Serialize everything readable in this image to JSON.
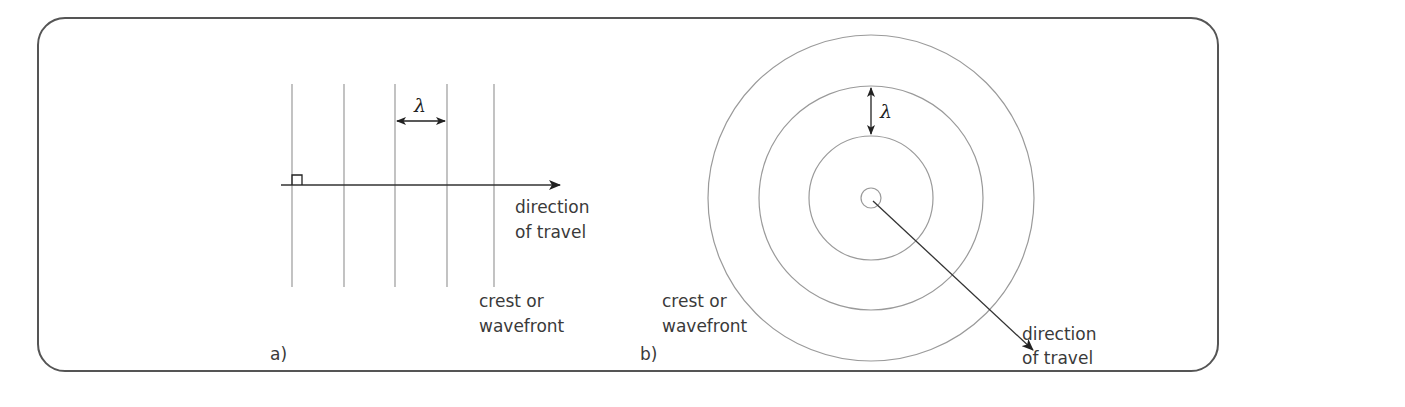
{
  "figure": {
    "panel_a": {
      "label": "a)",
      "description": "plane wavefronts",
      "wavelength_symbol": "λ",
      "direction_label_line1": "direction",
      "direction_label_line2": "of travel",
      "wavefront_label_line1": "crest or",
      "wavefront_label_line2": "wavefront",
      "wavefront_count": 5
    },
    "panel_b": {
      "label": "b)",
      "description": "circular wavefronts",
      "wavelength_symbol": "λ",
      "direction_label_line1": "direction",
      "direction_label_line2": "of travel",
      "wavefront_label_line1": "crest or",
      "wavefront_label_line2": "wavefront",
      "ring_count": 4
    },
    "colors": {
      "frame": "#555555",
      "wavefront": "#9a9a9a",
      "arrow": "#222222",
      "text": "#3a3a3a"
    }
  }
}
